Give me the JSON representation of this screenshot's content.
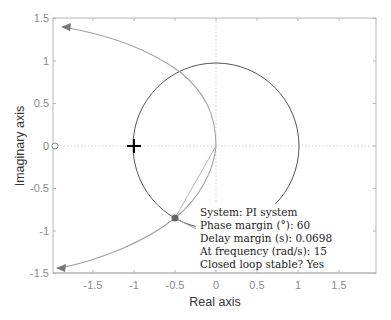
{
  "chart_data": {
    "type": "line",
    "title": "",
    "xlabel": "Real axis",
    "ylabel": "Imaginary axis",
    "xlim": [
      -1.99,
      1.96
    ],
    "ylim": [
      -1.5,
      1.5
    ],
    "grid": false,
    "zero_lines": true,
    "x_ticks": [
      -1.5,
      -1,
      -0.5,
      0,
      0.5,
      1,
      1.5
    ],
    "x_tick_labels": [
      "-1.5",
      "-1",
      "-0.5",
      "0",
      "0.5",
      "1",
      "1.5"
    ],
    "y_ticks": [
      -1.5,
      -1,
      -0.5,
      0,
      0.5,
      1,
      1.5
    ],
    "y_tick_labels": [
      "-1.5",
      "-1",
      "-0.5",
      "0",
      "0.5",
      "1",
      "1.5"
    ],
    "series": [
      {
        "name": "Unit circle",
        "kind": "arc",
        "center": [
          0,
          0
        ],
        "radius": 1,
        "color": "#555555"
      },
      {
        "name": "Nyquist (positive frequencies)",
        "color": "#a0a0a0",
        "x": [
          0,
          -0.03,
          -0.1,
          -0.27,
          -0.52,
          -0.91,
          -1.4,
          -1.88
        ],
        "y": [
          0,
          -0.19,
          -0.37,
          -0.57,
          -0.85,
          -1.08,
          -1.28,
          -1.43
        ]
      },
      {
        "name": "Nyquist (negative frequencies)",
        "color": "#a0a0a0",
        "x": [
          0,
          -0.03,
          -0.1,
          -0.27,
          -0.52,
          -0.91,
          -1.4,
          -1.88
        ],
        "y": [
          0,
          0.19,
          0.37,
          0.57,
          0.85,
          1.08,
          1.28,
          1.43
        ]
      }
    ],
    "markers": [
      {
        "name": "critical-point",
        "symbol": "+",
        "x": -1,
        "y": 0,
        "color": "#000000"
      },
      {
        "name": "phase-margin-point",
        "symbol": "filled-circle",
        "x": -0.5,
        "y": -0.866,
        "color": "#666666"
      },
      {
        "name": "open-loop-pole",
        "symbol": "open-circle",
        "x": -1.98,
        "y": 0,
        "color": "#888888"
      }
    ],
    "annotation": {
      "lines": [
        "System:  PI system",
        "Phase margin (°): 60",
        "Delay margin (s): 0.0698",
        "At frequency (rad/s): 15",
        "Closed loop stable?  Yes"
      ]
    },
    "system": "PI system",
    "phase_margin_deg": 60,
    "delay_margin_s": 0.0698,
    "frequency_rad_s": 15,
    "closed_loop_stable": "Yes"
  }
}
